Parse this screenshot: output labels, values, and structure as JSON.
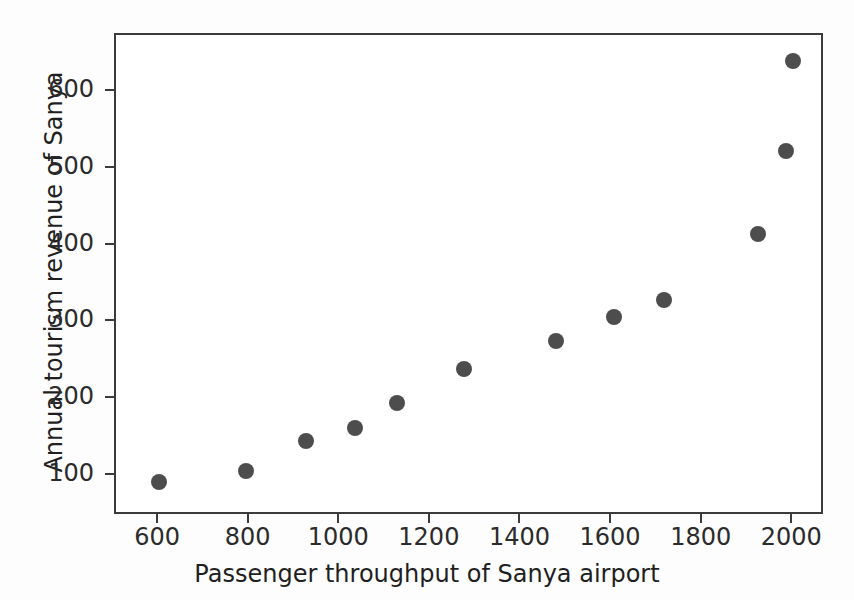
{
  "chart_data": {
    "type": "scatter",
    "title": "",
    "xlabel": "Passenger throughput of Sanya airport",
    "ylabel": "Annual tourism revenue of Sanya",
    "xlim": [
      505,
      2070
    ],
    "ylim": [
      48,
      674
    ],
    "xticks": [
      600,
      800,
      1000,
      1200,
      1400,
      1600,
      1800,
      2000
    ],
    "yticks": [
      100,
      200,
      300,
      400,
      500,
      600
    ],
    "xtick_labels": [
      "600",
      "800",
      "1000",
      "1200",
      "1400",
      "1600",
      "1800",
      "2000"
    ],
    "ytick_labels": [
      "100",
      "200",
      "300",
      "400",
      "500",
      "600"
    ],
    "grid": false,
    "legend": null,
    "marker": "circle",
    "marker_color": "#4d4d4d",
    "marker_size": 16,
    "series": [
      {
        "name": "Sanya",
        "x": [
          600,
          793,
          924,
          1033,
          1126,
          1274,
          1476,
          1604,
          1715,
          1922,
          1985,
          2000
        ],
        "y": [
          92,
          106,
          146,
          163,
          195,
          239,
          276,
          307,
          329,
          415,
          523,
          640
        ]
      }
    ],
    "points": [
      {
        "x": 600,
        "y": 92
      },
      {
        "x": 793,
        "y": 106
      },
      {
        "x": 924,
        "y": 146
      },
      {
        "x": 1033,
        "y": 163
      },
      {
        "x": 1126,
        "y": 195
      },
      {
        "x": 1274,
        "y": 239
      },
      {
        "x": 1476,
        "y": 276
      },
      {
        "x": 1604,
        "y": 307
      },
      {
        "x": 1715,
        "y": 329
      },
      {
        "x": 1922,
        "y": 415
      },
      {
        "x": 1985,
        "y": 523
      },
      {
        "x": 2000,
        "y": 640
      }
    ]
  },
  "colors": {
    "marker": "#4d4d4d",
    "axis": "#3b3b3b",
    "text": "#1f1f1f",
    "background": "#ffffff"
  }
}
